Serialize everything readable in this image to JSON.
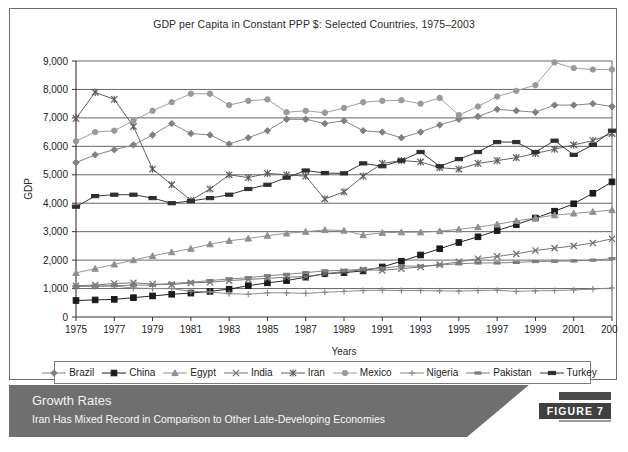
{
  "figure": {
    "title": "GDP per Capita in Constant PPP $: Selected Countries, 1975–2003",
    "banner_heading": "Growth Rates",
    "banner_subheading": "Iran Has Mixed Record in Comparison to Other Late-Developing Economies",
    "figure_tag": "FIGURE 7"
  },
  "chart_data": {
    "type": "line",
    "title": "GDP per Capita in Constant PPP $: Selected Countries, 1975–2003",
    "xlabel": "Years",
    "ylabel": "GDP",
    "xlim": [
      1975,
      2003
    ],
    "ylim": [
      0,
      9000
    ],
    "grid": true,
    "legend_position": "bottom",
    "x": [
      1975,
      1976,
      1977,
      1978,
      1979,
      1980,
      1981,
      1982,
      1983,
      1984,
      1985,
      1986,
      1987,
      1988,
      1989,
      1990,
      1991,
      1992,
      1993,
      1994,
      1995,
      1996,
      1997,
      1998,
      1999,
      2000,
      2001,
      2002,
      2003
    ],
    "y_ticks": [
      "0",
      "1,000",
      "2,000",
      "3,000",
      "4,000",
      "5,000",
      "6,000",
      "7,000",
      "8,000",
      "9,000"
    ],
    "x_ticks": [
      "1975",
      "1977",
      "1979",
      "1981",
      "1983",
      "1985",
      "1987",
      "1989",
      "1991",
      "1993",
      "1995",
      "1997",
      "1999",
      "2001",
      "2003"
    ],
    "series": [
      {
        "name": "Brazil",
        "marker": "diamond",
        "color": "#808080",
        "values": [
          5430,
          5700,
          5880,
          6050,
          6400,
          6800,
          6450,
          6400,
          6080,
          6300,
          6550,
          6950,
          6950,
          6800,
          6900,
          6550,
          6500,
          6300,
          6500,
          6750,
          6950,
          7050,
          7300,
          7250,
          7200,
          7450,
          7450,
          7500,
          7400
        ]
      },
      {
        "name": "China",
        "marker": "square",
        "color": "#1a1a1a",
        "values": [
          580,
          600,
          620,
          680,
          740,
          800,
          840,
          900,
          980,
          1100,
          1200,
          1280,
          1400,
          1520,
          1560,
          1620,
          1760,
          1960,
          2180,
          2400,
          2620,
          2820,
          3040,
          3250,
          3480,
          3720,
          3980,
          4350,
          4750
        ]
      },
      {
        "name": "Egypt",
        "marker": "triangle",
        "color": "#8f8f8f",
        "values": [
          1550,
          1700,
          1850,
          2000,
          2150,
          2280,
          2400,
          2560,
          2680,
          2760,
          2860,
          2940,
          3000,
          3060,
          3040,
          2880,
          2960,
          2980,
          2980,
          3020,
          3080,
          3160,
          3260,
          3380,
          3480,
          3580,
          3640,
          3700,
          3760
        ]
      },
      {
        "name": "India",
        "marker": "x",
        "color": "#707070",
        "values": [
          1100,
          1120,
          1180,
          1200,
          1160,
          1140,
          1200,
          1220,
          1280,
          1320,
          1360,
          1400,
          1420,
          1520,
          1600,
          1660,
          1640,
          1700,
          1760,
          1840,
          1940,
          2050,
          2130,
          2220,
          2340,
          2420,
          2500,
          2600,
          2750
        ]
      },
      {
        "name": "Iran",
        "marker": "asterisk",
        "color": "#5a5a5a",
        "values": [
          6980,
          7900,
          7650,
          6700,
          5200,
          4650,
          4100,
          4500,
          5000,
          4900,
          5050,
          5000,
          4950,
          4150,
          4400,
          4950,
          5400,
          5500,
          5450,
          5250,
          5200,
          5400,
          5500,
          5600,
          5750,
          5900,
          6050,
          6200,
          6450
        ]
      },
      {
        "name": "Mexico",
        "marker": "circle",
        "color": "#9a9a9a",
        "values": [
          6180,
          6500,
          6550,
          6900,
          7250,
          7550,
          7850,
          7850,
          7450,
          7600,
          7650,
          7200,
          7250,
          7180,
          7350,
          7550,
          7600,
          7620,
          7500,
          7700,
          7100,
          7400,
          7750,
          7950,
          8150,
          8950,
          8750,
          8700,
          8700
        ]
      },
      {
        "name": "Nigeria",
        "marker": "plus",
        "color": "#888888",
        "values": [
          1080,
          1080,
          1090,
          1020,
          1000,
          1000,
          900,
          880,
          820,
          800,
          850,
          850,
          830,
          870,
          900,
          930,
          940,
          930,
          930,
          920,
          910,
          930,
          940,
          900,
          920,
          930,
          950,
          980,
          1020
        ]
      },
      {
        "name": "Pakistan",
        "marker": "dash",
        "color": "#7d7d7d",
        "values": [
          1080,
          1090,
          1100,
          1120,
          1120,
          1180,
          1220,
          1280,
          1340,
          1380,
          1450,
          1500,
          1560,
          1620,
          1640,
          1680,
          1720,
          1790,
          1790,
          1830,
          1870,
          1900,
          1900,
          1920,
          1950,
          1960,
          1970,
          2000,
          2050
        ]
      },
      {
        "name": "Turkey",
        "marker": "thickdash",
        "color": "#2e2e2e",
        "values": [
          3880,
          4250,
          4300,
          4300,
          4180,
          4000,
          4080,
          4180,
          4300,
          4500,
          4650,
          4900,
          5150,
          5060,
          5050,
          5400,
          5300,
          5500,
          5800,
          5300,
          5550,
          5800,
          6150,
          6150,
          5800,
          6200,
          5700,
          6050,
          6550
        ]
      }
    ]
  },
  "axes": {
    "y_label": "GDP",
    "x_label": "Years"
  }
}
